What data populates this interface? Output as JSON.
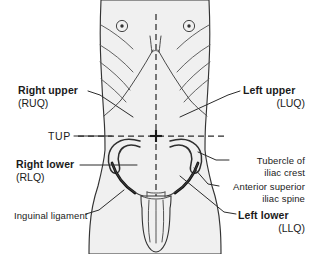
{
  "figure": {
    "colors": {
      "background": "#ffffff",
      "body_fill": "#f0f0f0",
      "outline": "#333333",
      "detail_line": "#555555",
      "text": "#1a1a1a",
      "dashed_axis": "#2b2b2b",
      "ligament": "#111111"
    }
  },
  "labels": {
    "right_upper": {
      "line1": "Right upper",
      "line2": "(RUQ)"
    },
    "left_upper": {
      "line1": "Left upper",
      "line2": "(LUQ)"
    },
    "right_lower": {
      "line1": "Right lower",
      "line2": "(RLQ)"
    },
    "left_lower": {
      "line1": "Left lower",
      "line2": "(LLQ)"
    },
    "tup": {
      "line1": "TUP"
    },
    "tubercle_of_iliac_crest": {
      "line1": "Tubercle of",
      "line2": "iliac crest"
    },
    "anterior_superior_iliac_spine": {
      "line1": "Anterior superior",
      "line2": "iliac spine"
    },
    "inguinal_ligament": {
      "line1": "Inguinal ligament"
    }
  },
  "anatomy": {
    "midline_axis": "vertical dashed median plane",
    "transverse_axis": "horizontal dashed transumbilical plane",
    "crosshair_center": "umbilicus",
    "parts": [
      "nipple-right",
      "nipple-left",
      "rib-lines-right",
      "rib-lines-left",
      "costal-margin-right",
      "costal-margin-left",
      "iliac-crest-right",
      "iliac-crest-left",
      "inguinal-ligament-right",
      "inguinal-ligament-left",
      "pubic-region"
    ]
  }
}
